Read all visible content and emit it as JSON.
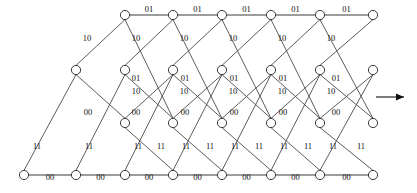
{
  "diagram": {
    "type": "trellis",
    "states": [
      "11",
      "01",
      "10",
      "00"
    ],
    "state_rows_y": [
      15,
      70,
      123,
      175
    ],
    "time_steps": 9,
    "step_x": [
      24,
      76,
      125,
      173,
      222,
      271,
      320,
      373
    ],
    "direction_arrow": "right-arrow",
    "node_radius": 4.6
  },
  "labels": {
    "top_branch": "01",
    "upper_diag": "10",
    "mid_diag": "10",
    "lower_diag": "01",
    "inner_diag": "00",
    "up_branch": "11",
    "bottom_branch": "00"
  },
  "chart_data": {
    "type": "diagram",
    "row_labels": [
      "11",
      "01",
      "10",
      "00"
    ],
    "branch_outputs": {
      "00_to_00": "00",
      "00_to_01": "11",
      "01_to_10": "01",
      "01_to_11": "10",
      "10_to_00": "00",
      "10_to_01": "11",
      "11_to_10": "01",
      "11_to_11": "01"
    },
    "top_row_edge_labels": [
      "01",
      "01",
      "01",
      "01",
      "01"
    ],
    "bottom_row_edge_labels": [
      "00",
      "00",
      "00",
      "00",
      "00",
      "00",
      "00"
    ],
    "label_10_count": 10,
    "label_01_count": 11,
    "label_00_count": 12,
    "label_11_count": 11
  }
}
